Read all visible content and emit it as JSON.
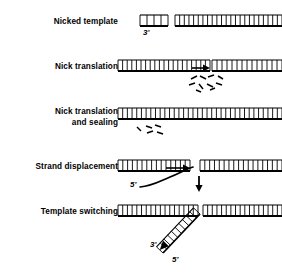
{
  "figure": {
    "background_color": "#ffffff",
    "ink_color": "#000000",
    "width": 282,
    "height": 275
  },
  "rows": [
    {
      "id": "nicked-template",
      "label": "Nicked template",
      "label_x": 18,
      "label_y": 16,
      "label_width": 100,
      "duplex": {
        "y": 15,
        "height": 11,
        "segments": [
          {
            "x": 140,
            "width": 28,
            "rungs": 4
          },
          {
            "x": 175,
            "width": 107,
            "rungs": 23
          }
        ],
        "nick_gap": {
          "x": 168,
          "width": 7
        }
      },
      "annotations": [
        {
          "text": "3'",
          "x": 143,
          "y": 28
        }
      ],
      "arrows": [],
      "fragments": []
    },
    {
      "id": "nick-translation",
      "label": "Nick translation",
      "label_x": 18,
      "label_y": 61,
      "label_width": 100,
      "duplex": {
        "y": 60,
        "height": 11,
        "segments": [
          {
            "x": 118,
            "width": 92,
            "rungs": 20
          },
          {
            "x": 212,
            "width": 70,
            "rungs": 14
          }
        ],
        "nick_gap": {
          "x": 210,
          "width": 2
        }
      },
      "annotations": [],
      "arrows": [
        {
          "type": "horizontal-right",
          "x1": 192,
          "y1": 68,
          "x2": 210,
          "y2": 68
        }
      ],
      "fragments": [
        {
          "x1": 191,
          "y1": 79,
          "x2": 197,
          "y2": 76
        },
        {
          "x1": 200,
          "y1": 76,
          "x2": 206,
          "y2": 79
        },
        {
          "x1": 208,
          "y1": 77,
          "x2": 214,
          "y2": 75
        },
        {
          "x1": 218,
          "y1": 76,
          "x2": 223,
          "y2": 79
        },
        {
          "x1": 189,
          "y1": 85,
          "x2": 195,
          "y2": 83
        },
        {
          "x1": 199,
          "y1": 84,
          "x2": 203,
          "y2": 89
        },
        {
          "x1": 207,
          "y1": 84,
          "x2": 213,
          "y2": 87
        },
        {
          "x1": 216,
          "y1": 83,
          "x2": 222,
          "y2": 85
        },
        {
          "x1": 196,
          "y1": 90,
          "x2": 201,
          "y2": 92
        },
        {
          "x1": 210,
          "y1": 90,
          "x2": 215,
          "y2": 88
        }
      ]
    },
    {
      "id": "nick-translation-and-sealing",
      "label": "Nick translation\nand sealing",
      "label_x": 18,
      "label_y": 106,
      "label_width": 100,
      "duplex": {
        "y": 108,
        "height": 11,
        "segments": [
          {
            "x": 118,
            "width": 164,
            "rungs": 35
          }
        ],
        "nick_gap": null
      },
      "annotations": [],
      "arrows": [],
      "fragments": [
        {
          "x1": 137,
          "y1": 127,
          "x2": 141,
          "y2": 131
        },
        {
          "x1": 146,
          "y1": 126,
          "x2": 152,
          "y2": 128
        },
        {
          "x1": 155,
          "y1": 125,
          "x2": 161,
          "y2": 127
        },
        {
          "x1": 147,
          "y1": 133,
          "x2": 153,
          "y2": 131
        },
        {
          "x1": 157,
          "y1": 132,
          "x2": 163,
          "y2": 134
        }
      ]
    },
    {
      "id": "strand-displacement",
      "label": "Strand displacement",
      "label_x": 14,
      "label_y": 161,
      "label_width": 104,
      "duplex": {
        "y": 160,
        "height": 11,
        "segments": [
          {
            "x": 118,
            "width": 72,
            "rungs": 15
          },
          {
            "x": 200,
            "width": 82,
            "rungs": 17
          }
        ],
        "nick_gap": {
          "x": 190,
          "width": 10
        }
      },
      "annotations": [
        {
          "text": "5'",
          "x": 130,
          "y": 186
        }
      ],
      "arrows": [
        {
          "type": "horizontal-right",
          "x1": 166,
          "y1": 168,
          "x2": 190,
          "y2": 168
        },
        {
          "type": "vertical-down",
          "x1": 199,
          "y1": 176,
          "x2": 199,
          "y2": 192
        }
      ],
      "displaced_strand": "M 140 187 C 152 186 158 182 170 177 C 180 173 186 169 193 167",
      "fragments": []
    },
    {
      "id": "template-switching",
      "label": "Template switching",
      "label_x": 16,
      "label_y": 206,
      "label_width": 102,
      "duplex": {
        "y": 205,
        "height": 11,
        "segments": [
          {
            "x": 118,
            "width": 80,
            "rungs": 17
          },
          {
            "x": 203,
            "width": 79,
            "rungs": 17
          }
        ],
        "nick_gap": {
          "x": 198,
          "width": 5
        }
      },
      "annotations": [
        {
          "text": "3'",
          "x": 152,
          "y": 247
        },
        {
          "text": "5'",
          "x": 173,
          "y": 262
        }
      ],
      "arrows": [],
      "branch": {
        "x1": 200,
        "y1": 214,
        "x2": 163,
        "y2": 253,
        "rungs": 10,
        "width": 9,
        "arrowhead": true
      },
      "fragments": []
    }
  ]
}
